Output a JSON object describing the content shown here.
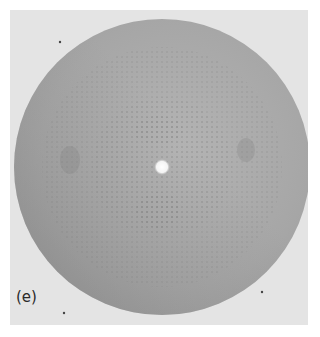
{
  "figure": {
    "panel_label": "(e)",
    "colors": {
      "background": "#e4e4e4",
      "disc": "#a9a9a9",
      "disc_dark": "#8f8f8f",
      "center_spot": "#ffffff",
      "spots": "#555555"
    }
  }
}
